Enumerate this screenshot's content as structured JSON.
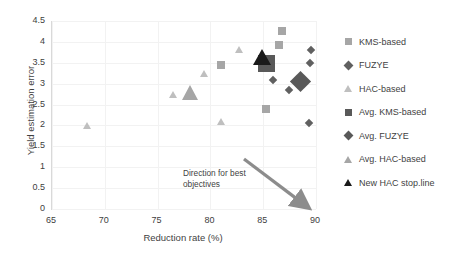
{
  "chart_data": {
    "type": "scatter",
    "title": "",
    "xlabel": "Reduction rate (%)",
    "ylabel": "Yield estimation error",
    "xlim": [
      65,
      90
    ],
    "ylim": [
      0,
      4.5
    ],
    "xticks": [
      65,
      70,
      75,
      80,
      85,
      90
    ],
    "yticks": [
      0,
      0.5,
      1,
      1.5,
      2,
      2.5,
      3,
      3.5,
      4,
      4.5
    ],
    "grid": true,
    "legend_position": "right",
    "annotations": [
      {
        "text_line1": "Direction for best",
        "text_line2": "objectives",
        "arrow_from": [
          83.2,
          1.2
        ],
        "arrow_to": [
          88.7,
          0.15
        ]
      }
    ],
    "series": [
      {
        "name": "KMS-based",
        "marker": "square",
        "color": "#a6a6a6",
        "size": 8,
        "points": [
          {
            "x": 81.0,
            "y": 3.44
          },
          {
            "x": 85.25,
            "y": 2.4
          },
          {
            "x": 86.75,
            "y": 4.26
          },
          {
            "x": 86.5,
            "y": 3.92
          }
        ]
      },
      {
        "name": "FUZYE",
        "marker": "diamond",
        "color": "#606060",
        "size": 6,
        "points": [
          {
            "x": 85.9,
            "y": 3.09
          },
          {
            "x": 87.4,
            "y": 2.84
          },
          {
            "x": 89.5,
            "y": 3.81
          },
          {
            "x": 89.4,
            "y": 3.49
          },
          {
            "x": 89.3,
            "y": 2.07
          }
        ]
      },
      {
        "name": "HAC-based",
        "marker": "triangle",
        "color": "#bfbfbf",
        "size": 8,
        "points": [
          {
            "x": 68.3,
            "y": 2.0
          },
          {
            "x": 76.5,
            "y": 2.74
          },
          {
            "x": 79.4,
            "y": 3.24
          },
          {
            "x": 81.0,
            "y": 2.09
          },
          {
            "x": 82.7,
            "y": 3.82
          }
        ]
      },
      {
        "name": "Avg. KMS-based",
        "marker": "square",
        "color": "#595959",
        "size": 17,
        "points": [
          {
            "x": 85.3,
            "y": 3.48
          }
        ]
      },
      {
        "name": "Avg. FUZYE",
        "marker": "diamond",
        "color": "#595959",
        "size": 15,
        "points": [
          {
            "x": 88.5,
            "y": 3.06
          }
        ]
      },
      {
        "name": "Avg. HAC-based",
        "marker": "triangle",
        "color": "#a6a6a6",
        "size": 17,
        "points": [
          {
            "x": 78.1,
            "y": 2.78
          }
        ]
      },
      {
        "name": "New HAC stop.line",
        "marker": "triangle",
        "color": "#1a1a1a",
        "size": 18,
        "points": [
          {
            "x": 84.9,
            "y": 3.62
          }
        ]
      }
    ]
  },
  "legend": {
    "items": [
      {
        "label": "KMS-based",
        "marker": "square",
        "color": "#a6a6a6"
      },
      {
        "label": "FUZYE",
        "marker": "diamond",
        "color": "#606060"
      },
      {
        "label": "HAC-based",
        "marker": "triangle",
        "color": "#bfbfbf"
      },
      {
        "label": "Avg. KMS-based",
        "marker": "square",
        "color": "#595959"
      },
      {
        "label": "Avg. FUZYE",
        "marker": "diamond",
        "color": "#595959"
      },
      {
        "label": "Avg. HAC-based",
        "marker": "triangle",
        "color": "#a6a6a6"
      },
      {
        "label": "New HAC stop.line",
        "marker": "triangle",
        "color": "#1a1a1a"
      }
    ]
  },
  "axes": {
    "x_title": "Reduction rate (%)",
    "y_title": "Yield estimation error",
    "x_tick_labels": [
      "65",
      "70",
      "75",
      "80",
      "85",
      "90"
    ],
    "y_tick_labels": [
      "4.5",
      "4",
      "3.5",
      "3",
      "2.5",
      "2",
      "1.5",
      "1",
      "0.5",
      "0"
    ]
  },
  "annotation": {
    "line1": "Direction for best",
    "line2": "objectives"
  }
}
